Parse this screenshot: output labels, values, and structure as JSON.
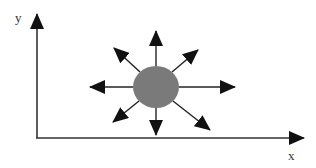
{
  "diagram": {
    "axes": {
      "x_label": "x",
      "y_label": "y"
    },
    "center_shape": {
      "type": "ellipse",
      "fill": "#7a7a7a",
      "description": "gray disk emitting arrows"
    },
    "arrows": {
      "count": 8,
      "directions": [
        "up",
        "up-right",
        "right",
        "down-right",
        "down",
        "down-left",
        "left",
        "up-left"
      ]
    },
    "colors": {
      "stroke": "#222222",
      "disk": "#7a7a7a"
    }
  }
}
